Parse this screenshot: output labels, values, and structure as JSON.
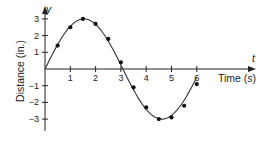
{
  "chart_data": {
    "type": "scatter",
    "title": "",
    "xlabel": "Time (s)",
    "xlabel_parts": {
      "prefix": "Time (",
      "var": "s",
      "suffix": ")"
    },
    "ylabel": "Distance (in.)",
    "x_axis_var": "t",
    "y_axis_var": "y",
    "xlim": [
      0,
      8.3
    ],
    "ylim": [
      -3.7,
      3.6
    ],
    "x_ticks": [
      1,
      2,
      3,
      4,
      5,
      6
    ],
    "y_ticks": [
      -3,
      -2,
      -1,
      1,
      2,
      3
    ],
    "grid": false,
    "legend": null,
    "series": [
      {
        "name": "measured",
        "style": "points",
        "x": [
          0.5,
          1.0,
          1.5,
          2.0,
          2.5,
          3.0,
          3.5,
          4.0,
          4.5,
          5.0,
          5.5,
          6.0
        ],
        "y": [
          1.4,
          2.5,
          3.0,
          2.7,
          1.8,
          0.4,
          -1.1,
          -2.3,
          -3.0,
          -2.9,
          -2.2,
          -0.9
        ]
      },
      {
        "name": "fitted curve",
        "style": "line",
        "model": "y = 3 sin(1.02 t)",
        "amplitude": 3.0,
        "angular_frequency": 1.02,
        "t_range": [
          0,
          6.0
        ]
      }
    ]
  },
  "colors": {
    "axis": "#222222",
    "curve": "#333333",
    "points": "#111111",
    "background": "#ffffff"
  },
  "labels": {
    "x_axis_var": "t",
    "y_axis_var": "y",
    "x_title_prefix": "Time (",
    "x_title_var": "s",
    "x_title_suffix": ")",
    "y_title": "Distance (in.)"
  }
}
